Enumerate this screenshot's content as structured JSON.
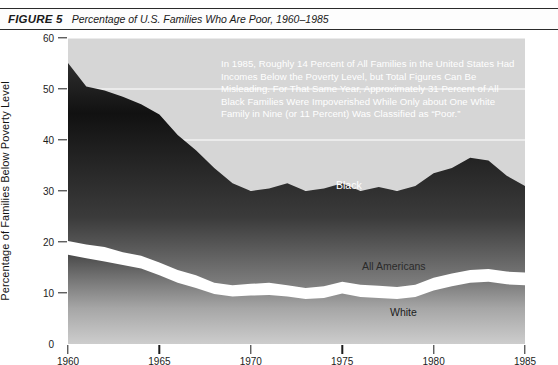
{
  "caption": {
    "label": "FIGURE 5",
    "text": "Percentage of U.S. Families Who Are Poor, 1960–1985"
  },
  "annotation": "In 1985, Roughly 14 Percent of All Families in the United States Had Incomes Below the Poverty Level, but Total Figures Can Be Misleading. For That Same Year, Approximately 31 Percent of All Black Families Were Impoverished While Only about One White Family in Nine (or 11 Percent) Was Classified as “Poor.”",
  "series_labels": {
    "black": "Black",
    "all_americans": "All Americans",
    "white": "White"
  },
  "colors": {
    "plot_background": "#d6d6d6",
    "band_dark": "#151515",
    "gridline": "#ffffff",
    "axis": "#1c1c1c",
    "caption_rule": "#2b2b2b"
  },
  "chart_data": {
    "type": "area",
    "title": "Percentage of U.S. Families Who Are Poor, 1960–1985",
    "xlabel": "",
    "ylabel": "Percentage of Families Below Poverty Level",
    "xlim": [
      1960,
      1985
    ],
    "ylim": [
      0,
      60
    ],
    "xticks": [
      1960,
      1965,
      1970,
      1975,
      1980,
      1985
    ],
    "yticks": [
      0,
      10,
      20,
      30,
      40,
      50,
      60
    ],
    "grid": true,
    "legend": "inline-labels",
    "x": [
      1960,
      1961,
      1962,
      1963,
      1964,
      1965,
      1966,
      1967,
      1968,
      1969,
      1970,
      1971,
      1972,
      1973,
      1974,
      1975,
      1976,
      1977,
      1978,
      1979,
      1980,
      1981,
      1982,
      1983,
      1984,
      1985
    ],
    "series": [
      {
        "name": "Black",
        "values": [
          55.1,
          50.5,
          49.7,
          48.5,
          47.0,
          45.0,
          41.0,
          38.0,
          34.5,
          31.5,
          30.0,
          30.5,
          31.5,
          30.0,
          30.5,
          31.5,
          30.0,
          30.8,
          30.0,
          31.0,
          33.5,
          34.5,
          36.5,
          36.0,
          33.0,
          31.0
        ]
      },
      {
        "name": "All Americans",
        "values": [
          20.2,
          19.5,
          19.0,
          18.0,
          17.3,
          16.0,
          14.5,
          13.5,
          12.0,
          11.5,
          11.8,
          12.0,
          11.5,
          11.0,
          11.3,
          12.2,
          11.6,
          11.4,
          11.2,
          11.6,
          13.0,
          13.8,
          14.5,
          14.7,
          14.2,
          14.0
        ]
      },
      {
        "name": "White",
        "values": [
          17.5,
          16.8,
          16.2,
          15.5,
          14.8,
          13.5,
          12.0,
          11.0,
          9.8,
          9.3,
          9.5,
          9.6,
          9.3,
          8.8,
          9.0,
          9.9,
          9.2,
          9.0,
          8.8,
          9.2,
          10.5,
          11.3,
          12.0,
          12.2,
          11.7,
          11.5
        ]
      }
    ]
  }
}
